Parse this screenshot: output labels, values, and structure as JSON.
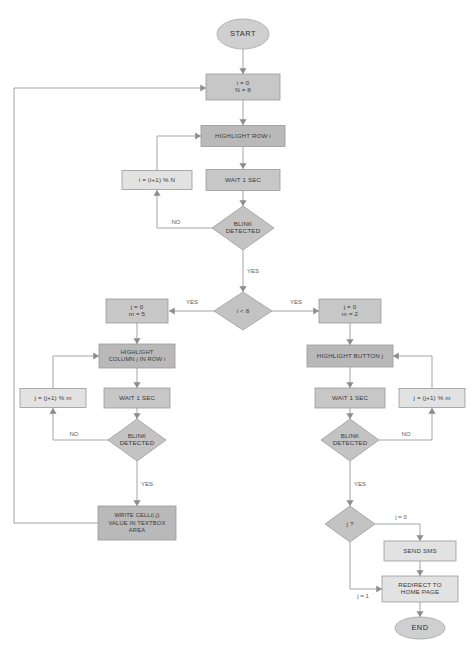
{
  "diagram": {
    "type": "flowchart",
    "canvas": {
      "width": 476,
      "height": 649
    },
    "colors": {
      "process_dark": "#b9b9b9",
      "process_mid": "#c7c7c7",
      "process_light": "#e2e2e2",
      "decision": "#c3c3c3",
      "terminal": "#cfcfcf",
      "edge": "#9b9b9b",
      "text": "#3a3a3a",
      "background": "#ffffff"
    },
    "nodes": [
      {
        "id": "start",
        "shape": "ellipse",
        "fill": "terminal",
        "x": 243,
        "y": 34,
        "w": 52,
        "h": 30,
        "lines": [
          "START"
        ],
        "style": "terminal"
      },
      {
        "id": "init_i",
        "shape": "rect",
        "fill": "fill-mid",
        "x": 243,
        "y": 87,
        "w": 74,
        "h": 26,
        "lines": [
          "i = 0",
          "N = 8"
        ]
      },
      {
        "id": "hl_row",
        "shape": "rect",
        "fill": "fill-dark",
        "x": 243,
        "y": 136,
        "w": 84,
        "h": 21,
        "lines": [
          "HIGHLIGHT ROW i"
        ]
      },
      {
        "id": "wait1",
        "shape": "rect",
        "fill": "fill-mid",
        "x": 243,
        "y": 180,
        "w": 74,
        "h": 21,
        "lines": [
          "WAIT 1 SEC"
        ]
      },
      {
        "id": "blink1",
        "shape": "diamond",
        "fill": "decision",
        "x": 243,
        "y": 228,
        "w": 62,
        "h": 44,
        "lines": [
          "BLINK",
          "DETECTED"
        ]
      },
      {
        "id": "inc_i",
        "shape": "rect",
        "fill": "fill-light",
        "x": 157,
        "y": 180,
        "w": 70,
        "h": 19,
        "lines": [
          "i = (i+1) % N"
        ]
      },
      {
        "id": "cmp_i",
        "shape": "diamond",
        "fill": "decision",
        "x": 243,
        "y": 311,
        "w": 58,
        "h": 38,
        "lines": [
          "i < 8"
        ]
      },
      {
        "id": "init_j_left",
        "shape": "rect",
        "fill": "fill-mid",
        "x": 137,
        "y": 311,
        "w": 62,
        "h": 24,
        "lines": [
          "j = 0",
          "m = 5"
        ]
      },
      {
        "id": "hl_col",
        "shape": "rect",
        "fill": "fill-dark",
        "x": 137,
        "y": 356,
        "w": 76,
        "h": 24,
        "lines": [
          "HIGHLIGHT",
          "COLUMN j IN ROW i"
        ],
        "style": "small"
      },
      {
        "id": "wait2",
        "shape": "rect",
        "fill": "fill-mid",
        "x": 137,
        "y": 398,
        "w": 66,
        "h": 20,
        "lines": [
          "WAIT 1 SEC"
        ]
      },
      {
        "id": "blink2",
        "shape": "diamond",
        "fill": "decision",
        "x": 137,
        "y": 440,
        "w": 58,
        "h": 42,
        "lines": [
          "BLINK",
          "DETECTED"
        ]
      },
      {
        "id": "inc_j_left",
        "shape": "rect",
        "fill": "fill-light",
        "x": 53,
        "y": 398,
        "w": 66,
        "h": 19,
        "lines": [
          "j = (j+1) % m"
        ]
      },
      {
        "id": "write_cell",
        "shape": "rect",
        "fill": "fill-dark",
        "x": 137,
        "y": 523,
        "w": 78,
        "h": 34,
        "lines": [
          "WRITE CELL(i,j)",
          "VALUE IN TEXTBOX",
          "AREA"
        ],
        "style": "small"
      },
      {
        "id": "init_j_right",
        "shape": "rect",
        "fill": "fill-mid",
        "x": 350,
        "y": 311,
        "w": 62,
        "h": 24,
        "lines": [
          "j = 0",
          "m = 2"
        ]
      },
      {
        "id": "hl_button",
        "shape": "rect",
        "fill": "fill-dark",
        "x": 350,
        "y": 356,
        "w": 86,
        "h": 22,
        "lines": [
          "HIGHLIGHT BUTTON j"
        ]
      },
      {
        "id": "wait3",
        "shape": "rect",
        "fill": "fill-mid",
        "x": 350,
        "y": 398,
        "w": 70,
        "h": 20,
        "lines": [
          "WAIT 1 SEC"
        ]
      },
      {
        "id": "blink3",
        "shape": "diamond",
        "fill": "decision",
        "x": 350,
        "y": 440,
        "w": 58,
        "h": 42,
        "lines": [
          "BLINK",
          "DETECTED"
        ]
      },
      {
        "id": "inc_j_right",
        "shape": "rect",
        "fill": "fill-light",
        "x": 432,
        "y": 398,
        "w": 66,
        "h": 19,
        "lines": [
          "j = (j+1) % m"
        ]
      },
      {
        "id": "check_j",
        "shape": "diamond",
        "fill": "decision",
        "x": 350,
        "y": 524,
        "w": 50,
        "h": 36,
        "lines": [
          "j ?"
        ]
      },
      {
        "id": "send_sms",
        "shape": "rect",
        "fill": "fill-light",
        "x": 420,
        "y": 551,
        "w": 72,
        "h": 20,
        "lines": [
          "SEND SMS"
        ]
      },
      {
        "id": "redirect",
        "shape": "rect",
        "fill": "fill-light",
        "x": 420,
        "y": 589,
        "w": 76,
        "h": 26,
        "lines": [
          "REDIRECT TO",
          "HOME PAGE"
        ]
      },
      {
        "id": "end",
        "shape": "ellipse",
        "fill": "terminal",
        "x": 420,
        "y": 628,
        "w": 50,
        "h": 22,
        "lines": [
          "END"
        ],
        "style": "terminal"
      }
    ],
    "edges": [
      {
        "id": "e-start-init",
        "points": "243,49 243,74",
        "arrow": "down",
        "label": ""
      },
      {
        "id": "e-init-hlrow",
        "points": "243,100 243,125",
        "arrow": "down",
        "label": ""
      },
      {
        "id": "e-hlrow-wait",
        "points": "243,147 243,169",
        "arrow": "down",
        "label": ""
      },
      {
        "id": "e-wait-blink",
        "points": "243,191 243,206",
        "arrow": "down",
        "label": ""
      },
      {
        "id": "e-blink-no",
        "points": "212,228 157,228 157,190",
        "arrow": "up",
        "label": "NO",
        "label_x": 176,
        "label_y": 222
      },
      {
        "id": "e-inci-hlrow",
        "points": "157,171 157,136 201,136",
        "arrow": "right",
        "label": ""
      },
      {
        "id": "e-blink-yes",
        "points": "243,250 243,292",
        "arrow": "down",
        "label": "YES",
        "label_x": 253,
        "label_y": 271
      },
      {
        "id": "e-cmp-yes-left",
        "points": "214,311 169,311",
        "arrow": "left",
        "label": "YES",
        "label_x": 192,
        "label_y": 302
      },
      {
        "id": "e-cmp-yes-right",
        "points": "272,311 319,311",
        "arrow": "right",
        "label": "YES",
        "label_x": 296,
        "label_y": 302
      },
      {
        "id": "e-initjl-hlcol",
        "points": "137,323 137,344",
        "arrow": "down",
        "label": ""
      },
      {
        "id": "e-hlcol-wait2",
        "points": "137,368 137,388",
        "arrow": "down",
        "label": ""
      },
      {
        "id": "e-wait2-blink2",
        "points": "137,408 137,419",
        "arrow": "down",
        "label": ""
      },
      {
        "id": "e-blink2-no",
        "points": "108,440 53,440 53,408",
        "arrow": "up",
        "label": "NO",
        "label_x": 74,
        "label_y": 434
      },
      {
        "id": "e-incjl-hlcol",
        "points": "53,389 53,356 99,356",
        "arrow": "right",
        "label": ""
      },
      {
        "id": "e-blink2-yes",
        "points": "137,461 137,506",
        "arrow": "down",
        "label": "YES",
        "label_x": 147,
        "label_y": 484
      },
      {
        "id": "e-write-loop",
        "points": "98,523 14,523 14,88 206,88",
        "arrow": "right",
        "label": ""
      },
      {
        "id": "e-initjr-hlbtn",
        "points": "350,323 350,345",
        "arrow": "down",
        "label": ""
      },
      {
        "id": "e-hlbtn-wait3",
        "points": "350,367 350,388",
        "arrow": "down",
        "label": ""
      },
      {
        "id": "e-wait3-blink3",
        "points": "350,408 350,419",
        "arrow": "down",
        "label": ""
      },
      {
        "id": "e-blink3-no",
        "points": "379,440 432,440 432,408",
        "arrow": "up",
        "label": "NO",
        "label_x": 406,
        "label_y": 434
      },
      {
        "id": "e-incjr-hlbtn",
        "points": "432,389 432,356 393,356",
        "arrow": "left",
        "label": ""
      },
      {
        "id": "e-blink3-yes",
        "points": "350,461 350,506",
        "arrow": "down",
        "label": "YES",
        "label_x": 360,
        "label_y": 484
      },
      {
        "id": "e-checkj-0",
        "points": "375,524 420,524 420,541",
        "arrow": "down",
        "label": "j = 0",
        "label_x": 401,
        "label_y": 517
      },
      {
        "id": "e-sms-redirect",
        "points": "420,561 420,576",
        "arrow": "down",
        "label": ""
      },
      {
        "id": "e-checkj-1",
        "points": "350,542 350,589 382,589",
        "arrow": "right",
        "label": "j = 1",
        "label_x": 363,
        "label_y": 596
      },
      {
        "id": "e-redirect-end",
        "points": "420,602 420,617",
        "arrow": "down",
        "label": ""
      }
    ]
  }
}
